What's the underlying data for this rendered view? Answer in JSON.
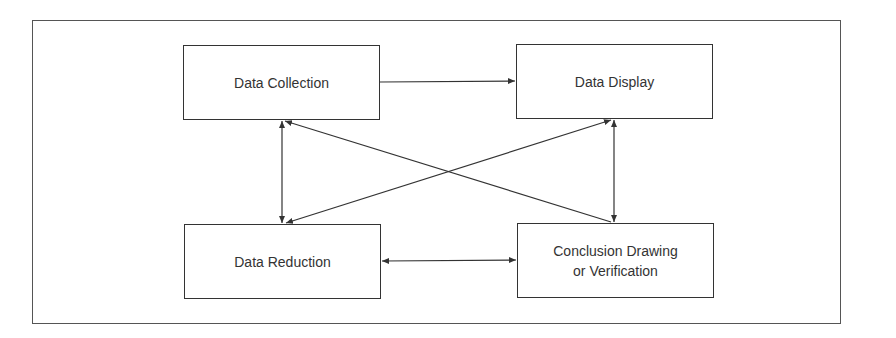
{
  "diagram": {
    "type": "flow",
    "nodes": [
      {
        "id": "collection",
        "label": "Data Collection"
      },
      {
        "id": "display",
        "label": "Data Display"
      },
      {
        "id": "reduction",
        "label": "Data Reduction"
      },
      {
        "id": "conclusion",
        "label": "Conclusion Drawing\nor Verification"
      }
    ],
    "edges": [
      {
        "from": "collection",
        "to": "display",
        "direction": "forward"
      },
      {
        "from": "reduction",
        "to": "conclusion",
        "direction": "both"
      },
      {
        "from": "collection",
        "to": "reduction",
        "direction": "both"
      },
      {
        "from": "display",
        "to": "conclusion",
        "direction": "both"
      },
      {
        "from": "conclusion",
        "to": "collection",
        "direction": "forward"
      },
      {
        "from": "reduction",
        "to": "display",
        "direction": "both"
      }
    ],
    "colors": {
      "stroke": "#333333",
      "frame": "#555555",
      "background": "#ffffff"
    }
  }
}
